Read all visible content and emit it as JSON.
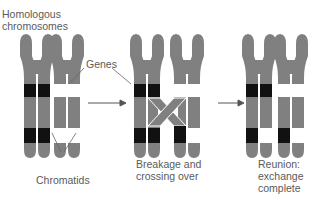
{
  "labels": {
    "homologous": [
      "Homologous",
      "chromosomes"
    ],
    "genes": "Genes",
    "chromatids": "Chromatids",
    "stage2": [
      "Breakage and",
      "crossing over"
    ],
    "stage3": [
      "Reunion:",
      "exchange",
      "complete"
    ]
  },
  "stages": [
    {
      "name": "homologous-chromosomes"
    },
    {
      "name": "breakage-and-crossing-over"
    },
    {
      "name": "reunion-exchange-complete"
    }
  ],
  "colors": {
    "chromosome": "#808080",
    "gene_dark": "#111111",
    "gene_light": "#ffffff",
    "text": "#5a5a5a",
    "arrow": "#555555"
  }
}
